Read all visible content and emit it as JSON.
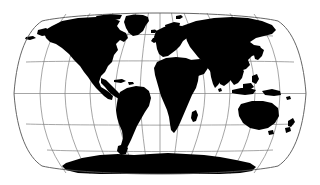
{
  "figure": {
    "projection": "Robinson",
    "background_color": "#ffffff",
    "land_color": "#000000",
    "ocean_color": "#ffffff",
    "graticule_color": "#808080",
    "frame_color": "#555555",
    "width": 320,
    "height": 185
  },
  "map": {
    "extent": {
      "left": 13,
      "right": 307,
      "top": 13,
      "bottom": 174
    },
    "center_x": 160,
    "center_y": 93.5,
    "half_width": 147,
    "half_height": 80.5,
    "graticule": {
      "meridian_interval_deg": 30,
      "parallel_interval_deg": 30,
      "meridians_deg": [
        -180,
        -150,
        -120,
        -90,
        -60,
        -30,
        0,
        30,
        60,
        90,
        120,
        150,
        180
      ],
      "parallels_deg": [
        -90,
        -60,
        -30,
        0,
        30,
        60,
        90
      ],
      "parallel_y_px": [
        174,
        150,
        124,
        93.5,
        62,
        36,
        13
      ],
      "meridian_x_at_equator_px": [
        13,
        37.5,
        62,
        86.5,
        111,
        135.5,
        160,
        184.5,
        209,
        233.5,
        258,
        282.5,
        307
      ],
      "show_grid": true
    }
  },
  "landmasses": [
    {
      "name": "north-america"
    },
    {
      "name": "greenland"
    },
    {
      "name": "south-america"
    },
    {
      "name": "africa"
    },
    {
      "name": "europe"
    },
    {
      "name": "asia"
    },
    {
      "name": "australia"
    },
    {
      "name": "new-zealand"
    },
    {
      "name": "indonesia"
    },
    {
      "name": "japan"
    },
    {
      "name": "madagascar"
    },
    {
      "name": "antarctica"
    },
    {
      "name": "british-isles"
    },
    {
      "name": "iceland"
    },
    {
      "name": "philippines"
    },
    {
      "name": "new-guinea"
    },
    {
      "name": "sri-lanka"
    },
    {
      "name": "cuba"
    },
    {
      "name": "borneo"
    },
    {
      "name": "svalbard"
    }
  ]
}
